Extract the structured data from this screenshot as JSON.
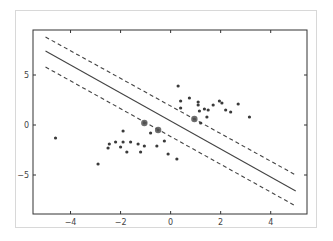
{
  "chart_data": {
    "type": "scatter",
    "title": "",
    "xlabel": "",
    "ylabel": "",
    "xlim": [
      -5.5,
      5.45
    ],
    "ylim": [
      -8.9,
      9.5
    ],
    "grid": false,
    "legend": null,
    "xticks": [
      -4,
      -2,
      0,
      2,
      4
    ],
    "yticks": [
      5,
      0,
      -5
    ],
    "xtick_labels": [
      "−4",
      "−2",
      "0",
      "2",
      "4"
    ],
    "ytick_labels": [
      "5",
      "0",
      "−5"
    ],
    "series": [
      {
        "name": "class-positive",
        "kind": "points",
        "x": [
          0.3,
          0.4,
          0.75,
          1.1,
          1.1,
          0.4,
          1.35,
          1.5,
          1.15,
          1.7,
          1.95,
          2.05,
          2.2,
          2.4,
          2.7,
          1.45,
          1.2,
          3.15,
          0.95
        ],
        "y": [
          3.9,
          2.4,
          2.7,
          2.3,
          2.0,
          1.7,
          1.6,
          1.5,
          1.4,
          2.0,
          2.4,
          2.2,
          1.5,
          1.3,
          2.1,
          0.8,
          0.2,
          0.8,
          0.6
        ]
      },
      {
        "name": "class-negative",
        "kind": "points",
        "x": [
          -4.6,
          -1.9,
          -0.8,
          -0.25,
          -2.45,
          -2.2,
          -1.9,
          -1.6,
          -1.3,
          -1.05,
          -0.55,
          -2.5,
          -2.0,
          -1.75,
          -1.2,
          -0.1,
          0.25,
          -2.9,
          -1.05,
          -0.5
        ],
        "y": [
          -1.3,
          -0.6,
          -0.8,
          -1.6,
          -1.9,
          -1.7,
          -1.7,
          -1.7,
          -1.9,
          -2.1,
          -2.1,
          -2.3,
          -2.2,
          -2.7,
          -2.7,
          -2.9,
          -3.4,
          -3.9,
          0.2,
          -0.5
        ]
      },
      {
        "name": "support-vectors",
        "kind": "points-large",
        "x": [
          -1.05,
          -0.5,
          0.95
        ],
        "y": [
          0.2,
          -0.5,
          0.6
        ]
      },
      {
        "name": "decision-boundary",
        "kind": "line-solid",
        "x": [
          -5,
          5
        ],
        "y": [
          7.4,
          -6.6
        ]
      },
      {
        "name": "margin-upper",
        "kind": "line-dashed",
        "x": [
          -5,
          5
        ],
        "y": [
          8.8,
          -5.0
        ]
      },
      {
        "name": "margin-lower",
        "kind": "line-dashed",
        "x": [
          -5,
          5
        ],
        "y": [
          5.8,
          -8.1
        ]
      }
    ]
  },
  "colors": {
    "points": "#3a3a3a",
    "support_vectors": "#555555",
    "lines": "#444444",
    "axes": "#333333",
    "frame": "#d8d8d8"
  },
  "plot_area": {
    "left": 33,
    "top": 30,
    "right": 307,
    "bottom": 214
  }
}
